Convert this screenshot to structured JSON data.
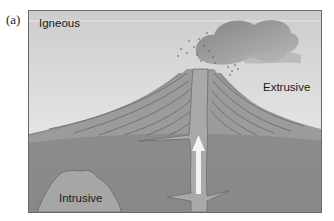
{
  "figure": {
    "panel_label": "(a)",
    "title": "Igneous",
    "labels": {
      "extrusive": "Extrusive",
      "intrusive": "Intrusive"
    },
    "colors": {
      "sky_top": "#cfcfcf",
      "sky_bottom": "#f2f2f2",
      "ground": "#8e8e8e",
      "volcano": "#9a9a9a",
      "strata_lines": "#6e6e6e",
      "conduit": "#a8a8a8",
      "magma_arrow": "#f4f4f4",
      "pluton": "#a6a6a6",
      "ash_cloud": "#8a8a8a"
    }
  }
}
